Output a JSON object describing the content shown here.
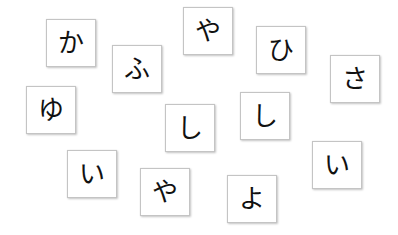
{
  "cards": [
    {
      "char": "か",
      "x": 46,
      "y": 19
    },
    {
      "char": "ふ",
      "x": 112,
      "y": 45
    },
    {
      "char": "や",
      "x": 183,
      "y": 7
    },
    {
      "char": "ひ",
      "x": 256,
      "y": 26
    },
    {
      "char": "さ",
      "x": 330,
      "y": 55
    },
    {
      "char": "ゆ",
      "x": 26,
      "y": 86
    },
    {
      "char": "し",
      "x": 165,
      "y": 104
    },
    {
      "char": "し",
      "x": 240,
      "y": 92
    },
    {
      "char": "い",
      "x": 67,
      "y": 150
    },
    {
      "char": "や",
      "x": 140,
      "y": 168
    },
    {
      "char": "よ",
      "x": 227,
      "y": 175
    },
    {
      "char": "い",
      "x": 312,
      "y": 141
    }
  ],
  "colors": {
    "background": "#ffffff",
    "card_border": "#c4c4c4",
    "glyph": "#111111"
  }
}
